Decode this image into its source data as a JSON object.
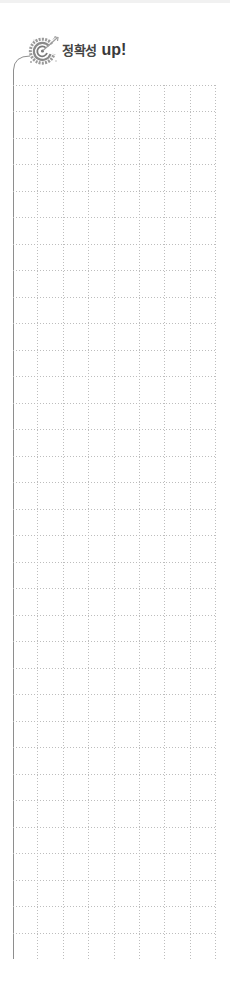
{
  "header": {
    "title_korean": "정확성",
    "title_english": "up!",
    "icon": "target-icon"
  },
  "grid": {
    "columns": 8,
    "rows": 33,
    "line_color": "#bdbdbd",
    "border_color": "#9a9a9a",
    "style": "dotted"
  },
  "colors": {
    "title_text": "#3a3a3a",
    "icon_gray": "#8a8a8a",
    "background": "#ffffff"
  }
}
